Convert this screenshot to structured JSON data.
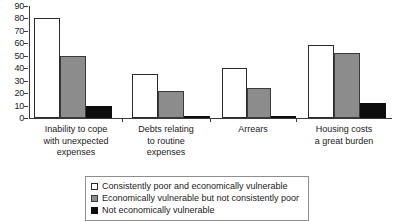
{
  "chart_data": {
    "type": "bar",
    "title": "",
    "subtitle": "",
    "xlabel": "",
    "ylabel": "",
    "ylim": [
      0,
      90
    ],
    "y_ticks": [
      0,
      10,
      20,
      30,
      40,
      50,
      60,
      70,
      80,
      90
    ],
    "grid": false,
    "legend_position": "bottom",
    "categories": [
      "Inability to cope with unexpected expenses",
      "Debts relating to routine expenses",
      "Arrears",
      "Housing costs a great burden"
    ],
    "category_lines": [
      [
        "Inability to cope",
        "with unexpected",
        "expenses"
      ],
      [
        "Debts relating",
        "to routine",
        "expenses"
      ],
      [
        "Arrears"
      ],
      [
        "Housing costs",
        "a great burden"
      ]
    ],
    "series": [
      {
        "name": "Consistently poor and economically vulnerable",
        "color": "#ffffff",
        "values": [
          80,
          35,
          40,
          59
        ]
      },
      {
        "name": "Economically vulnerable but not consistently poor",
        "color": "#8c8c8c",
        "values": [
          50,
          22,
          24,
          52
        ]
      },
      {
        "name": "Not economically vulnerable",
        "color": "#0d0d0d",
        "values": [
          10,
          2,
          2,
          12
        ]
      }
    ]
  }
}
